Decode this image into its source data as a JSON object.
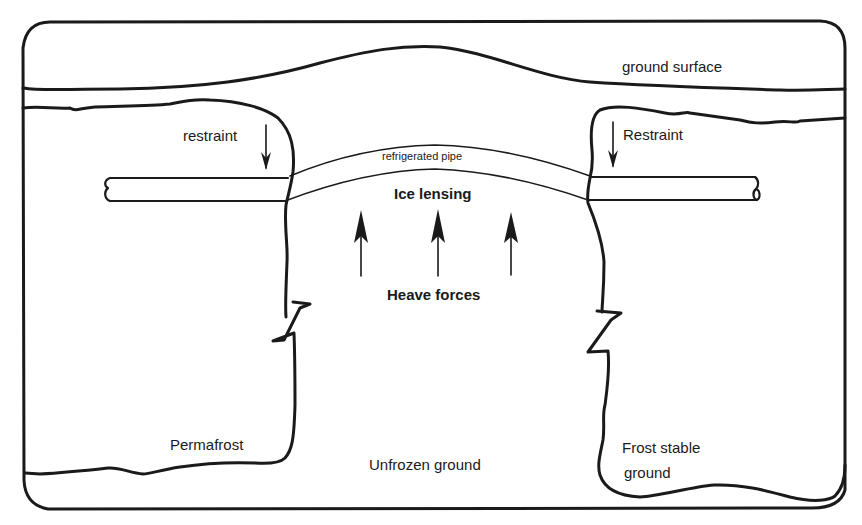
{
  "diagram": {
    "labels": {
      "ground_surface": "ground surface",
      "restraint_left": "restraint",
      "restraint_right": "Restraint",
      "refrigerated_pipe": "refrigerated pipe",
      "ice_lensing": "Ice lensing",
      "heave_forces": "Heave forces",
      "permafrost": "Permafrost",
      "unfrozen_ground": "Unfrozen ground",
      "frost_stable_line1": "Frost stable",
      "frost_stable_line2": "ground"
    },
    "regions": [
      {
        "name": "permafrost",
        "side": "left"
      },
      {
        "name": "unfrozen ground",
        "side": "center"
      },
      {
        "name": "frost stable ground",
        "side": "right"
      }
    ],
    "arrows": {
      "restraint": {
        "count": 2,
        "direction": "down"
      },
      "heave_forces": {
        "count": 3,
        "direction": "up"
      }
    },
    "colors": {
      "ink": "#1a1a1a",
      "background": "#ffffff"
    }
  }
}
